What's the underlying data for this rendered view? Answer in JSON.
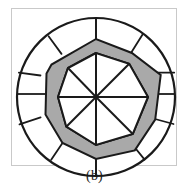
{
  "figure": {
    "caption": "(b)",
    "kind": "circular-sector-diagram",
    "frame": {
      "x": 11,
      "y": 8,
      "width": 166,
      "height": 158,
      "stroke": "#c9c9c9"
    },
    "colors": {
      "background": "#ffffff",
      "outline": "#1a1a1a",
      "band_fill": "#a9a9a9",
      "inner_fill": "#ffffff",
      "frame_stroke": "#c9c9c9",
      "caption_color": "#1a1a1a"
    },
    "center": {
      "x": 96,
      "y": 97
    },
    "outer_circle": {
      "radius": 79,
      "stroke_width": 2.2
    },
    "sector_divider_inner_radius": 60,
    "spokes": {
      "count": 8,
      "angles_deg": [
        0,
        45,
        90,
        135,
        180,
        225,
        270,
        315
      ],
      "stroke_width": 2.0
    },
    "sector_dividers": {
      "count": 10,
      "angles_deg": [
        18,
        54,
        90,
        126,
        162,
        198,
        234,
        270,
        306,
        342
      ]
    },
    "band_outer_polygon": {
      "note": "irregular decagon bounding the gray band on the outside",
      "points_deg_radius": [
        [
          90,
          58
        ],
        [
          126,
          55
        ],
        [
          162,
          52
        ],
        [
          198,
          53
        ],
        [
          234,
          57
        ],
        [
          270,
          62
        ],
        [
          306,
          66
        ],
        [
          342,
          68
        ],
        [
          18,
          66
        ],
        [
          54,
          61
        ]
      ]
    },
    "band_inner_polygon": {
      "note": "irregular polygon bounding the gray band on the inside",
      "points_deg_radius": [
        [
          90,
          44
        ],
        [
          135,
          40
        ],
        [
          180,
          38
        ],
        [
          225,
          42
        ],
        [
          270,
          48
        ],
        [
          315,
          52
        ],
        [
          0,
          52
        ],
        [
          45,
          47
        ]
      ]
    }
  }
}
